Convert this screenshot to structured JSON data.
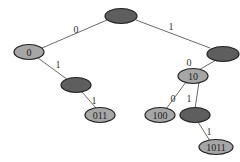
{
  "diagram": {
    "type": "binary-trie",
    "nodes": [
      {
        "id": "root",
        "label": "",
        "fill": "dark"
      },
      {
        "id": "n0",
        "label": "0",
        "fill": "light"
      },
      {
        "id": "n1",
        "label": "",
        "fill": "dark"
      },
      {
        "id": "n01",
        "label": "",
        "fill": "dark"
      },
      {
        "id": "n011",
        "label": "011",
        "fill": "light"
      },
      {
        "id": "n10",
        "label": "10",
        "fill": "light"
      },
      {
        "id": "n100",
        "label": "100",
        "fill": "light"
      },
      {
        "id": "n101",
        "label": "",
        "fill": "dark"
      },
      {
        "id": "n1011",
        "label": "1011",
        "fill": "light"
      }
    ],
    "edges": [
      {
        "from": "root",
        "to": "n0",
        "label": "0"
      },
      {
        "from": "root",
        "to": "n1",
        "label": "1"
      },
      {
        "from": "n0",
        "to": "n01",
        "label": "1"
      },
      {
        "from": "n01",
        "to": "n011",
        "label": "1"
      },
      {
        "from": "n1",
        "to": "n10",
        "label": "0"
      },
      {
        "from": "n10",
        "to": "n100",
        "label": "0"
      },
      {
        "from": "n10",
        "to": "n101",
        "label": "1"
      },
      {
        "from": "n101",
        "to": "n1011",
        "label": "1"
      }
    ],
    "colors": {
      "dark": "#5e5e5e",
      "light": "#a6a6a6",
      "stroke": "#222222",
      "edge": "#6a6a6a"
    }
  }
}
